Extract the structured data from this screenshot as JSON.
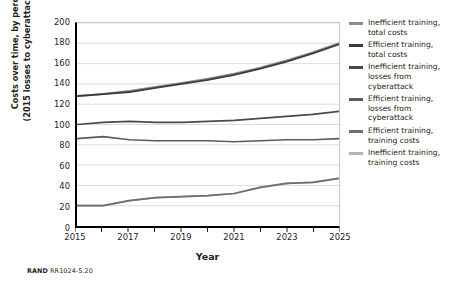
{
  "figure": {
    "source_note_prefix": "RAND",
    "source_note_id": "RR1024-5.20"
  },
  "chart_data": {
    "type": "line",
    "title": "",
    "xlabel": "Year",
    "ylabel": "Costs over time, by percentage (2015 losses to cyberattack = 100%)",
    "ylabel_line1": "Costs over time, by percentage",
    "ylabel_line2": "(2015 losses to cyberattack = 100%)",
    "x": [
      2015,
      2016,
      2017,
      2018,
      2019,
      2020,
      2021,
      2022,
      2023,
      2024,
      2025
    ],
    "xlim": [
      2015,
      2025
    ],
    "ylim": [
      0,
      200
    ],
    "xticks": [
      2015,
      2016,
      2017,
      2018,
      2019,
      2020,
      2021,
      2022,
      2023,
      2024,
      2025
    ],
    "xtick_labels": [
      "2015",
      "",
      "2017",
      "",
      "2019",
      "",
      "2021",
      "",
      "2023",
      "",
      "2025"
    ],
    "yticks": [
      0,
      20,
      40,
      60,
      80,
      100,
      120,
      140,
      160,
      180,
      200
    ],
    "ytick_labels": [
      "0",
      "20",
      "40",
      "60",
      "80",
      "100",
      "120",
      "140",
      "160",
      "180",
      "200"
    ],
    "grid": "horizontal",
    "legend_position": "right",
    "series": [
      {
        "name": "Inefficient training, total costs",
        "label_line1": "Inefficient training,",
        "label_line2": "total costs",
        "color": "#8c8c8c",
        "width": 2.0,
        "values": [
          128,
          130,
          133,
          137,
          141,
          145,
          150,
          156,
          163,
          171,
          180
        ]
      },
      {
        "name": "Efficient training, total costs",
        "label_line1": "Efficient training,",
        "label_line2": "total costs",
        "color": "#3b3b3b",
        "width": 1.8,
        "values": [
          128,
          130,
          132,
          136,
          140,
          144,
          149,
          155,
          162,
          170,
          179
        ]
      },
      {
        "name": "Inefficient training, losses from cyberattack",
        "label_line1": "Inefficient training,",
        "label_line2": "losses from",
        "label_line3": "cyberattack",
        "color": "#4a4a4a",
        "width": 1.7,
        "values": [
          100,
          102,
          103,
          102,
          102,
          103,
          104,
          106,
          108,
          110,
          113
        ]
      },
      {
        "name": "Efficient training, losses from cyberattack",
        "label_line1": "Efficient training,",
        "label_line2": "losses from",
        "label_line3": "cyberattack",
        "color": "#5a5a5a",
        "width": 1.7,
        "values": [
          86,
          88,
          85,
          84,
          84,
          84,
          83,
          84,
          85,
          85,
          86
        ]
      },
      {
        "name": "Efficient training, training costs",
        "label_line1": "Efficient training,",
        "label_line2": "training costs",
        "color": "#6e6e6e",
        "width": 1.7,
        "values": [
          20,
          20,
          25,
          28,
          29,
          30,
          32,
          38,
          42,
          43,
          47
        ]
      },
      {
        "name": "Inefficient training, training costs",
        "label_line1": "Inefficient training,",
        "label_line2": "training costs",
        "color": "#b4b4b4",
        "width": 1.7,
        "values": [
          20,
          20,
          25,
          28,
          29,
          30,
          32,
          38,
          42,
          43,
          47
        ]
      }
    ]
  }
}
